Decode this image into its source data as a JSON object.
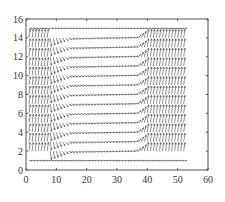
{
  "chart_data": {
    "type": "quiver",
    "title": "",
    "xlabel": "",
    "ylabel": "",
    "xlim": [
      0,
      60
    ],
    "ylim": [
      0,
      16
    ],
    "xticks": [
      "0",
      "10",
      "20",
      "30",
      "40",
      "50",
      "60"
    ],
    "yticks": [
      "0",
      "2",
      "4",
      "6",
      "8",
      "10",
      "12",
      "14",
      "16"
    ],
    "grid": false,
    "legend": null,
    "field": {
      "x_range": [
        1,
        52
      ],
      "y_rows": [
        1,
        2,
        3,
        4,
        5,
        6,
        7,
        8,
        9,
        10,
        11,
        12,
        13,
        14,
        15
      ],
      "description": "Vector field: near-vertical arrows for x<~8 and x>~38 (upward-leaning), horizontal arrows along rows between x~12 and x~38 curving at transitions; bottom row y=1 and top row y=15 horizontal across full width."
    }
  },
  "colors": {
    "axis": "#555555",
    "arrows": "#444444",
    "background": "#ffffff"
  }
}
